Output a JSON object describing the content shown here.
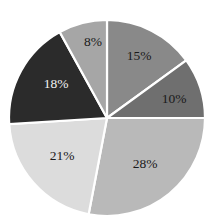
{
  "chart": {
    "background_color": "#ffffff",
    "center_x": 107,
    "center_y": 118,
    "radius": 98,
    "separator_color": "#ffffff"
  },
  "chart_data": {
    "type": "pie",
    "title": "",
    "subtitle": "",
    "xlabel": "",
    "ylabel": "",
    "grid": false,
    "legend": "none",
    "start_angle_deg": 0,
    "direction": "clockwise",
    "units": "percent",
    "total": 100,
    "categories": [
      "15%",
      "10%",
      "28%",
      "21%",
      "18%",
      "8%"
    ],
    "values": [
      15,
      10,
      28,
      21,
      18,
      8
    ],
    "labels": [
      "15%",
      "10%",
      "28%",
      "21%",
      "18%",
      "8%"
    ],
    "colors": [
      "#898989",
      "#6f6f6f",
      "#b9b9b9",
      "#dcdcdc",
      "#2b2b2b",
      "#a6a6a6"
    ],
    "label_colors": [
      "#1a1a1a",
      "#1a1a1a",
      "#1a1a1a",
      "#1a1a1a",
      "#f2f2f2",
      "#1a1a1a"
    ],
    "slices": [
      {
        "label": "15%",
        "value": 15,
        "color": "#898989",
        "label_color": "#1a1a1a",
        "label_x": 139,
        "label_y": 57
      },
      {
        "label": "10%",
        "value": 10,
        "color": "#6f6f6f",
        "label_color": "#1a1a1a",
        "label_x": 174,
        "label_y": 100
      },
      {
        "label": "28%",
        "value": 28,
        "color": "#b9b9b9",
        "label_color": "#1a1a1a",
        "label_x": 145,
        "label_y": 165
      },
      {
        "label": "21%",
        "value": 21,
        "color": "#dcdcdc",
        "label_color": "#1a1a1a",
        "label_x": 62,
        "label_y": 157
      },
      {
        "label": "18%",
        "value": 18,
        "color": "#2b2b2b",
        "label_color": "#f2f2f2",
        "label_x": 56,
        "label_y": 85
      },
      {
        "label": "8%",
        "value": 8,
        "color": "#a6a6a6",
        "label_color": "#1a1a1a",
        "label_x": 93,
        "label_y": 43
      }
    ]
  }
}
